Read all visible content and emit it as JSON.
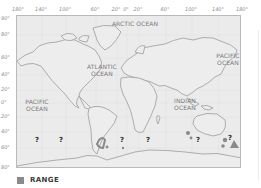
{
  "map": {
    "type": "world-distribution-map",
    "longitude_labels": [
      "180°",
      "140°",
      "100°",
      "60°",
      "20°",
      "0°",
      "20°",
      "60°",
      "100°",
      "140°",
      "180°"
    ],
    "latitude_labels": [
      "90°",
      "80°",
      "60°",
      "40°",
      "20°",
      "0°",
      "20°",
      "40°",
      "60°",
      "80°"
    ],
    "ocean_labels": {
      "arctic": "ARCTIC OCEAN",
      "atlantic_line1": "ATLANTIC",
      "atlantic_line2": "OCEAN",
      "pacific_west_line1": "PACIFIC",
      "pacific_west_line2": "OCEAN",
      "indian_line1": "INDIAN",
      "indian_line2": "OCEAN",
      "pacific_east_line1": "PACIFIC",
      "pacific_east_line2": "OCEAN"
    },
    "uncertain_marker": "?",
    "colors": {
      "background": "#ebebeb",
      "coastline": "#a5a5a5",
      "range": "#8a8a8a",
      "grid": "#dcdcdc"
    }
  },
  "legend": {
    "label": "RANGE",
    "swatch_color": "#8a8a8a"
  }
}
